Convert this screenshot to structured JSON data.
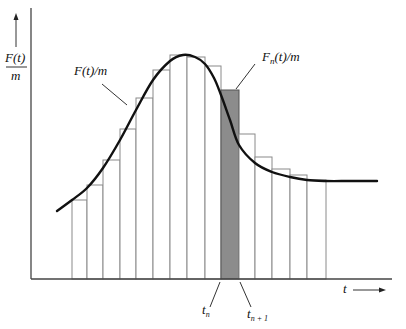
{
  "figure": {
    "ylabel_numerator": "F(t)",
    "ylabel_denominator": "m",
    "xlabel": "t",
    "curve_label": "F(t)/m",
    "shaded_label_prefix": "F",
    "shaded_label_sub": "n",
    "shaded_label_suffix": "(t)/m",
    "tick_left_base": "t",
    "tick_left_sub": "n",
    "tick_right_base": "t",
    "tick_right_sub": "n + 1",
    "colors": {
      "axis": "#444444",
      "curve": "#111111",
      "bar_outline": "#8a8a8a",
      "shaded_fill": "#8c8c8c"
    }
  },
  "chart_data": {
    "type": "bar",
    "title": "",
    "xlabel": "t",
    "ylabel": "F(t)/m",
    "baseline_y_px": 279,
    "strips": [
      {
        "x0": 72,
        "x1": 87,
        "top": 200,
        "shaded": false
      },
      {
        "x0": 87,
        "x1": 103,
        "top": 185,
        "shaded": false
      },
      {
        "x0": 103,
        "x1": 120,
        "top": 160,
        "shaded": false
      },
      {
        "x0": 120,
        "x1": 136,
        "top": 129,
        "shaded": false
      },
      {
        "x0": 136,
        "x1": 153,
        "top": 98,
        "shaded": false
      },
      {
        "x0": 153,
        "x1": 170,
        "top": 70,
        "shaded": false
      },
      {
        "x0": 170,
        "x1": 187,
        "top": 55,
        "shaded": false
      },
      {
        "x0": 187,
        "x1": 205,
        "top": 57,
        "shaded": false
      },
      {
        "x0": 205,
        "x1": 221,
        "top": 66,
        "shaded": false
      },
      {
        "x0": 221,
        "x1": 239,
        "top": 90,
        "shaded": true
      },
      {
        "x0": 239,
        "x1": 255,
        "top": 134,
        "shaded": false
      },
      {
        "x0": 255,
        "x1": 272,
        "top": 157,
        "shaded": false
      },
      {
        "x0": 272,
        "x1": 290,
        "top": 169,
        "shaded": false
      },
      {
        "x0": 290,
        "x1": 307,
        "top": 175,
        "shaded": false
      },
      {
        "x0": 307,
        "x1": 326,
        "top": 180,
        "shaded": false
      }
    ],
    "curve_points": [
      [
        57,
        211
      ],
      [
        72,
        200
      ],
      [
        87,
        188
      ],
      [
        103,
        168
      ],
      [
        120,
        140
      ],
      [
        136,
        110
      ],
      [
        153,
        80
      ],
      [
        170,
        61
      ],
      [
        183,
        55
      ],
      [
        195,
        57
      ],
      [
        205,
        64
      ],
      [
        214,
        78
      ],
      [
        221,
        95
      ],
      [
        230,
        120
      ],
      [
        239,
        145
      ],
      [
        255,
        163
      ],
      [
        272,
        172
      ],
      [
        290,
        177
      ],
      [
        307,
        180
      ],
      [
        326,
        181
      ],
      [
        350,
        181
      ],
      [
        377,
        181
      ]
    ],
    "grid": false,
    "legend": "none"
  }
}
